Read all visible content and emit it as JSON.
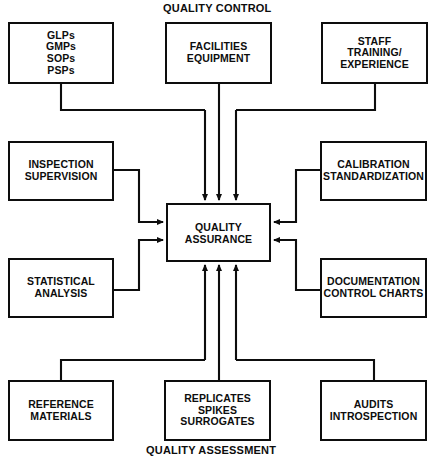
{
  "diagram": {
    "title_top": "QUALITY CONTROL",
    "title_bottom": "QUALITY ASSESSMENT",
    "center": {
      "id": "quality-assurance",
      "label": "QUALITY\nASSURANCE"
    },
    "nodes": [
      {
        "id": "glps",
        "label": "GLPs\nGMPs\nSOPs\nPSPs",
        "group": "quality-control",
        "position": "top-left"
      },
      {
        "id": "facilities",
        "label": "FACILITIES\nEQUIPMENT",
        "group": "quality-control",
        "position": "top-center"
      },
      {
        "id": "staff",
        "label": "STAFF\nTRAINING/\nEXPERIENCE",
        "group": "quality-control",
        "position": "top-right"
      },
      {
        "id": "inspection",
        "label": "INSPECTION\nSUPERVISION",
        "group": "left",
        "position": "middle-left-upper"
      },
      {
        "id": "statistical",
        "label": "STATISTICAL\nANALYSIS",
        "group": "left",
        "position": "middle-left-lower"
      },
      {
        "id": "calibration",
        "label": "CALIBRATION\nSTANDARDIZATION",
        "group": "right",
        "position": "middle-right-upper"
      },
      {
        "id": "documentation",
        "label": "DOCUMENTATION\nCONTROL CHARTS",
        "group": "right",
        "position": "middle-right-lower"
      },
      {
        "id": "reference",
        "label": "REFERENCE\nMATERIALS",
        "group": "quality-assessment",
        "position": "bottom-left"
      },
      {
        "id": "replicates",
        "label": "REPLICATES\nSPIKES\nSURROGATES",
        "group": "quality-assessment",
        "position": "bottom-center"
      },
      {
        "id": "audits",
        "label": "AUDITS\nINTROSPECTION",
        "group": "quality-assessment",
        "position": "bottom-right"
      }
    ],
    "connections": [
      {
        "from": "glps",
        "to": "quality-assurance",
        "direction": "down"
      },
      {
        "from": "facilities",
        "to": "quality-assurance",
        "direction": "down"
      },
      {
        "from": "staff",
        "to": "quality-assurance",
        "direction": "down"
      },
      {
        "from": "inspection",
        "to": "quality-assurance",
        "direction": "right"
      },
      {
        "from": "statistical",
        "to": "quality-assurance",
        "direction": "right"
      },
      {
        "from": "calibration",
        "to": "quality-assurance",
        "direction": "left"
      },
      {
        "from": "documentation",
        "to": "quality-assurance",
        "direction": "left"
      },
      {
        "from": "reference",
        "to": "quality-assurance",
        "direction": "up"
      },
      {
        "from": "replicates",
        "to": "quality-assurance",
        "direction": "up"
      },
      {
        "from": "audits",
        "to": "quality-assurance",
        "direction": "up"
      }
    ],
    "colors": {
      "stroke": "#0d0d0d",
      "background": "#ffffff",
      "text": "#0d0d0d"
    }
  }
}
